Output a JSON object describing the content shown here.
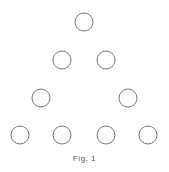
{
  "figure": {
    "caption": "Fig. 1",
    "stroke_color": "#777777",
    "circles": [
      {
        "row": 1,
        "cx": 84,
        "cy": 22,
        "r": 9
      },
      {
        "row": 2,
        "cx": 62,
        "cy": 60,
        "r": 9
      },
      {
        "row": 2,
        "cx": 106,
        "cy": 60,
        "r": 9
      },
      {
        "row": 3,
        "cx": 41,
        "cy": 98,
        "r": 9
      },
      {
        "row": 3,
        "cx": 128,
        "cy": 98,
        "r": 9
      },
      {
        "row": 4,
        "cx": 20,
        "cy": 135,
        "r": 9
      },
      {
        "row": 4,
        "cx": 62,
        "cy": 135,
        "r": 9
      },
      {
        "row": 4,
        "cx": 106,
        "cy": 135,
        "r": 9
      },
      {
        "row": 4,
        "cx": 148,
        "cy": 135,
        "r": 9
      }
    ]
  }
}
